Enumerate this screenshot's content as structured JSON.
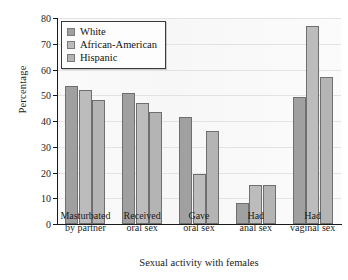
{
  "chart_data": {
    "type": "bar",
    "title": "",
    "xlabel": "Sexual activity with females",
    "ylabel": "Percentage",
    "ylim": [
      0,
      80
    ],
    "yticks": [
      0,
      10,
      20,
      30,
      40,
      50,
      60,
      70,
      80
    ],
    "grid": true,
    "legend_position": "top-left",
    "categories": [
      "Masturbated by partner",
      "Received oral sex",
      "Gave oral sex",
      "Had anal sex",
      "Had vaginal sex"
    ],
    "category_lines": [
      [
        "Masturbated",
        "by partner"
      ],
      [
        "Received",
        "oral sex"
      ],
      [
        "Gave",
        "oral sex"
      ],
      [
        "Had",
        "anal sex"
      ],
      [
        "Had",
        "vaginal sex"
      ]
    ],
    "series": [
      {
        "name": "White",
        "color": "#a0a0a0",
        "values": [
          53.5,
          51.0,
          41.5,
          8.0,
          49.5
        ]
      },
      {
        "name": "African-American",
        "color": "#bcbcbc",
        "values": [
          52.0,
          47.0,
          19.5,
          15.0,
          77.0
        ]
      },
      {
        "name": "Hispanic",
        "color": "#b4b4b4",
        "values": [
          48.0,
          43.5,
          36.0,
          15.0,
          57.0
        ]
      }
    ]
  },
  "legend": {
    "items": [
      {
        "label": "White"
      },
      {
        "label": "African-American"
      },
      {
        "label": "Hispanic"
      }
    ]
  },
  "axes": {
    "y_title": "Percentage",
    "x_title": "Sexual activity with females",
    "y_tick_labels": [
      "0",
      "10",
      "20",
      "30",
      "40",
      "50",
      "60",
      "70",
      "80"
    ]
  }
}
